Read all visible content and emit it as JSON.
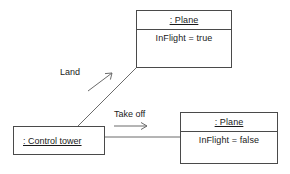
{
  "diagram": {
    "type": "uml-object-diagram",
    "background": "#ffffff",
    "line_color": "#6b6b6b",
    "border_color": "#4a4a4a",
    "text_color": "#1a1a1a",
    "objects": [
      {
        "id": "plane-in-flight",
        "name": ": Plane",
        "attribute": "InFlight = true",
        "x": 136,
        "y": 10,
        "width": 96,
        "height": 58,
        "header_height": 19
      },
      {
        "id": "plane-grounded",
        "name": ": Plane",
        "attribute": "InFlight = false",
        "x": 180,
        "y": 112,
        "width": 98,
        "height": 52,
        "header_height": 19
      },
      {
        "id": "control-tower",
        "name": ": Control tower",
        "attribute": "",
        "x": 13,
        "y": 126,
        "width": 92,
        "height": 29,
        "header_height": 0
      }
    ],
    "links": [
      {
        "id": "land-link",
        "label": "Land",
        "from": "control-tower",
        "to": "plane-in-flight",
        "label_x": 60,
        "label_y": 67,
        "line": {
          "x1": 78,
          "y1": 126,
          "x2": 136,
          "y2": 68
        },
        "arrow": {
          "x1": 88,
          "y1": 91,
          "x2": 112,
          "y2": 73
        }
      },
      {
        "id": "takeoff-link",
        "label": "Take off",
        "from": "control-tower",
        "to": "plane-grounded",
        "label_x": 114,
        "label_y": 109,
        "line": {
          "x1": 105,
          "y1": 137,
          "x2": 180,
          "y2": 137
        },
        "arrow": {
          "x1": 114,
          "y1": 126,
          "x2": 147,
          "y2": 126
        }
      }
    ]
  }
}
